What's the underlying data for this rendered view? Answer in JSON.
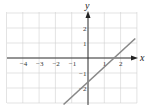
{
  "chart_data": {
    "type": "line",
    "title": "",
    "xlabel": "x",
    "ylabel": "y",
    "xlim": [
      -5,
      3
    ],
    "ylim": [
      -3,
      3
    ],
    "grid": true,
    "x_ticks": [
      -4,
      -3,
      -2,
      -1,
      1,
      2
    ],
    "y_ticks": [
      2,
      1,
      -1,
      -2
    ],
    "x_tick_labels": [
      "−4",
      "−3",
      "−2",
      "−1",
      "1",
      "2"
    ],
    "y_tick_labels": [
      "2",
      "1",
      "−1",
      "−2"
    ],
    "series": [
      {
        "name": "line",
        "equation": "y = x - 1.6",
        "x": [
          -1.5,
          2.9
        ],
        "y": [
          -3.1,
          1.3
        ],
        "color": "#888888"
      }
    ],
    "x_intercept": 1.6,
    "y_intercept": -1.6
  },
  "colors": {
    "grid": "#d0d0d0",
    "axis": "#222222",
    "line": "#888888"
  }
}
